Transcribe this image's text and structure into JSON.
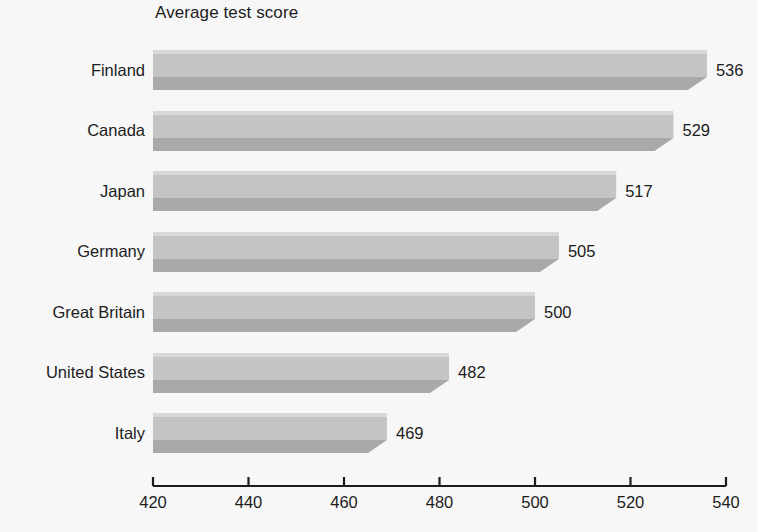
{
  "chart_data": {
    "type": "bar",
    "orientation": "horizontal",
    "title": "Average test score",
    "xlabel": "",
    "ylabel": "",
    "categories": [
      "Finland",
      "Canada",
      "Japan",
      "Germany",
      "Great Britain",
      "United States",
      "Italy"
    ],
    "values": [
      536,
      529,
      517,
      505,
      500,
      482,
      469
    ],
    "value_labels": [
      "536",
      "529",
      "517",
      "505",
      "500",
      "482",
      "469"
    ],
    "xlim": [
      420,
      540
    ],
    "xticks": [
      420,
      440,
      460,
      480,
      500,
      520,
      540
    ],
    "xtick_labels": [
      "420",
      "440",
      "460",
      "480",
      "500",
      "520",
      "540"
    ],
    "grid": false,
    "legend": "none",
    "colors": {
      "background": "#f7f7f7",
      "bar_face": "#c4c4c4",
      "bar_shadow": "#a9a9a9",
      "bar_top_highlight": "#d8d8d8",
      "axis": "#1c1c1c",
      "text": "#1c1c1c"
    }
  },
  "axis": {
    "tick_0": "420",
    "tick_1": "440",
    "tick_2": "460",
    "tick_3": "480",
    "tick_4": "500",
    "tick_5": "520",
    "tick_6": "540"
  },
  "rows": [
    {
      "label": "Finland",
      "value": "536"
    },
    {
      "label": "Canada",
      "value": "529"
    },
    {
      "label": "Japan",
      "value": "517"
    },
    {
      "label": "Germany",
      "value": "505"
    },
    {
      "label": "Great Britain",
      "value": "500"
    },
    {
      "label": "United States",
      "value": "482"
    },
    {
      "label": "Italy",
      "value": "469"
    }
  ]
}
